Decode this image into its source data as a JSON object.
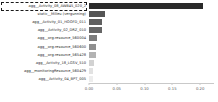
{
  "chart_data": {
    "type": "bar",
    "orientation": "horizontal",
    "title": "",
    "xlabel": "",
    "ylabel": "",
    "xlim": [
      0,
      0.225
    ],
    "grid": false,
    "legend": null,
    "xticks": [
      "0.00",
      "0.05",
      "0.10",
      "0.15",
      "0.20"
    ],
    "xtick_values": [
      0.0,
      0.05,
      0.1,
      0.15,
      0.2
    ],
    "categories": [
      "agg__Activity_08_AWB45_020_2",
      "static__Milieu (vergunning)",
      "agg__Activity_01_HOOFD_011",
      "agg__Activity_02_DRZ_010",
      "agg__org:resource_560004",
      "agg__org:resource_560600",
      "agg__org:resource_565428",
      "agg__Activity_18_LGSV_510",
      "agg__monitoringResource_560429",
      "agg__Activity_04_BPT_005"
    ],
    "values": [
      0.206,
      0.029,
      0.024,
      0.023,
      0.014,
      0.013,
      0.012,
      0.009,
      0.008,
      0.007
    ],
    "bar_colors": [
      "#2a2a2a",
      "#555555",
      "#5f5f5f",
      "#666666",
      "#7d7d7d",
      "#8f8f8f",
      "#b3b3b3",
      "#d2d2d2",
      "#e2e2e2",
      "#ededed"
    ],
    "selected_category": "agg__Activity_08_AWB45_020_2",
    "axis_color": "#c9c9c9",
    "label_color": "#2b2b2b",
    "tick_color": "#5a5a5a"
  }
}
